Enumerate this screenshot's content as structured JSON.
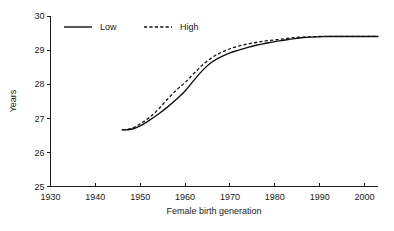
{
  "chart_data": {
    "type": "line",
    "title": "",
    "subtitle": "",
    "xlabel": "Female birth generation",
    "ylabel": "Years",
    "xlim": [
      1930,
      2003
    ],
    "ylim": [
      25,
      30
    ],
    "xticks": [
      1930,
      1940,
      1950,
      1960,
      1970,
      1980,
      1990,
      2000
    ],
    "xtick_labels": [
      "1930",
      "1940",
      "1950",
      "1960",
      "1970",
      "1980",
      "1990",
      "2000"
    ],
    "yticks": [
      25,
      26,
      27,
      28,
      29,
      30
    ],
    "ytick_labels": [
      "25",
      "26",
      "27",
      "28",
      "29",
      "30"
    ],
    "grid": false,
    "legend_position": "top-left-inside",
    "legend_entries": [
      {
        "name": "Low",
        "style": "solid"
      },
      {
        "name": "High",
        "style": "dashed"
      }
    ],
    "series": [
      {
        "name": "Low",
        "style": "solid",
        "x": [
          1946,
          1948,
          1950,
          1952,
          1954,
          1956,
          1958,
          1960,
          1962,
          1964,
          1966,
          1968,
          1970,
          1972,
          1974,
          1976,
          1978,
          1980,
          1982,
          1984,
          1986,
          1988,
          1990,
          1992,
          1995,
          2000,
          2003
        ],
        "values": [
          26.66,
          26.68,
          26.78,
          26.94,
          27.12,
          27.32,
          27.55,
          27.8,
          28.12,
          28.42,
          28.65,
          28.8,
          28.92,
          29.0,
          29.08,
          29.15,
          29.2,
          29.25,
          29.29,
          29.33,
          29.36,
          29.38,
          29.39,
          29.4,
          29.4,
          29.4,
          29.4
        ]
      },
      {
        "name": "High",
        "style": "dashed",
        "x": [
          1946,
          1948,
          1950,
          1952,
          1954,
          1956,
          1958,
          1960,
          1962,
          1964,
          1966,
          1968,
          1970,
          1972,
          1974,
          1976,
          1978,
          1980,
          1982,
          1984,
          1986,
          1988,
          1990,
          1992,
          1995,
          2000,
          2003
        ],
        "values": [
          26.66,
          26.7,
          26.84,
          27.02,
          27.26,
          27.55,
          27.82,
          28.05,
          28.32,
          28.58,
          28.78,
          28.93,
          29.04,
          29.12,
          29.18,
          29.23,
          29.27,
          29.3,
          29.33,
          29.36,
          29.38,
          29.39,
          29.4,
          29.4,
          29.4,
          29.4,
          29.4
        ]
      }
    ],
    "colors": {
      "series_line": "#121212",
      "axis": "#1a1a1a",
      "background": "#ffffff"
    },
    "notes": {
      "data_start_year": 1946,
      "convergence_year": 1988,
      "plateau_value": 29.4
    }
  }
}
